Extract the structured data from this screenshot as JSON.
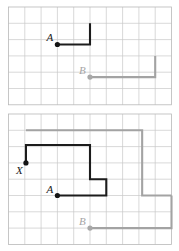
{
  "figure": {
    "background_color": "#ffffff",
    "grid_color": "#c9c9c9",
    "dark_color": "#1c1c1c",
    "gray_color": "#a3a3a3",
    "cell_size": 16.3,
    "panels": [
      {
        "id": "top-panel",
        "name": "top-grid-panel",
        "origin": {
          "x": 8.5,
          "y": 7.0
        },
        "columns": 10,
        "rows": 6,
        "points": [
          {
            "label": "A",
            "color": "dark",
            "col": 3,
            "row": 2.3,
            "label_dx": -11,
            "label_dy": -3
          },
          {
            "label": "B",
            "color": "gray",
            "col": 5,
            "row": 4.3,
            "label_dx": -11,
            "label_dy": -3
          }
        ],
        "paths": [
          {
            "name": "path-A-dark",
            "color": "dark",
            "vertices": [
              [
                3,
                2.3
              ],
              [
                5,
                2.3
              ],
              [
                5,
                1.0
              ]
            ]
          },
          {
            "name": "path-B-gray",
            "color": "gray",
            "vertices": [
              [
                5,
                4.3
              ],
              [
                9,
                4.3
              ],
              [
                9,
                3.0
              ]
            ]
          }
        ]
      },
      {
        "id": "bottom-panel",
        "name": "bottom-grid-panel",
        "origin": {
          "x": 8.5,
          "y": 114.0
        },
        "columns": 10,
        "rows": 8,
        "points": [
          {
            "label": "X",
            "color": "dark",
            "col": 1.07,
            "row": 3.0,
            "label_dx": -10,
            "label_dy": 11
          },
          {
            "label": "A",
            "color": "dark",
            "col": 3.0,
            "row": 5.0,
            "label_dx": -11,
            "label_dy": -3
          },
          {
            "label": "B",
            "color": "gray",
            "col": 5.0,
            "row": 7.0,
            "label_dx": -11,
            "label_dy": -3
          }
        ],
        "paths": [
          {
            "name": "path-X-dark",
            "color": "dark",
            "vertices": [
              [
                1.07,
                3.0
              ],
              [
                1.07,
                1.9
              ],
              [
                5.0,
                1.9
              ],
              [
                5.0,
                4.0
              ],
              [
                6.0,
                4.0
              ],
              [
                6.0,
                5.0
              ],
              [
                3.0,
                5.0
              ]
            ]
          },
          {
            "name": "path-gray-upper",
            "color": "gray",
            "vertices": [
              [
                1.07,
                1.0
              ],
              [
                8.2,
                1.0
              ],
              [
                8.2,
                5.0
              ],
              [
                10.0,
                5.0
              ]
            ]
          },
          {
            "name": "path-gray-lower",
            "color": "gray",
            "vertices": [
              [
                5.0,
                7.0
              ],
              [
                10.0,
                7.0
              ],
              [
                10.0,
                5.0
              ]
            ]
          }
        ]
      }
    ]
  }
}
